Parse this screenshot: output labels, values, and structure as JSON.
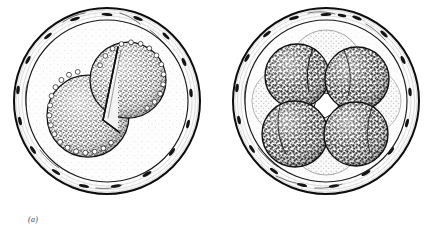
{
  "figure": {
    "type": "scientific-line-drawing",
    "background_color": "#ffffff",
    "ink_color": "#111111"
  },
  "panels": [
    {
      "id": "a",
      "caption": "(a)",
      "stage_label": "two-cell stage",
      "center": {
        "x": 107,
        "y": 101
      },
      "outer_radius": 93,
      "inner_radius": 81,
      "zona": {
        "name": "zona-pellucida",
        "fill": "#fbfbfb",
        "follicular_marks": 18
      },
      "blastomeres": [
        {
          "cx": 88,
          "cy": 116,
          "r": 41,
          "tone": "dark-stipple"
        },
        {
          "cx": 128,
          "cy": 80,
          "r": 38,
          "tone": "dark-stipple"
        }
      ],
      "cleavage_furrow": true,
      "central_cavity": false
    },
    {
      "id": "b",
      "caption": "(b)",
      "stage_label": "four- to eight-cell stage",
      "center": {
        "x": 326,
        "y": 101
      },
      "outer_radius": 93,
      "inner_radius": 81,
      "zona": {
        "name": "zona-pellucida",
        "fill": "#fbfbfb",
        "follicular_marks": 18
      },
      "background_blastomeres": [
        {
          "cx": 326,
          "cy": 66,
          "r": 36,
          "tone": "light-stipple"
        },
        {
          "cx": 326,
          "cy": 139,
          "r": 36,
          "tone": "light-stipple"
        },
        {
          "cx": 285,
          "cy": 101,
          "r": 33,
          "tone": "light-stipple"
        },
        {
          "cx": 368,
          "cy": 101,
          "r": 33,
          "tone": "light-stipple"
        }
      ],
      "blastomeres": [
        {
          "cx": 297,
          "cy": 76,
          "r": 32,
          "tone": "dark-reticulate"
        },
        {
          "cx": 357,
          "cy": 79,
          "r": 32,
          "tone": "dark-reticulate"
        },
        {
          "cx": 295,
          "cy": 134,
          "r": 33,
          "tone": "dark-reticulate"
        },
        {
          "cx": 356,
          "cy": 134,
          "r": 32,
          "tone": "dark-reticulate"
        }
      ],
      "central_cavity": true,
      "central_cavity_color": "#ffffff"
    }
  ],
  "captions": {
    "a": "(a)",
    "b": "(b)"
  }
}
